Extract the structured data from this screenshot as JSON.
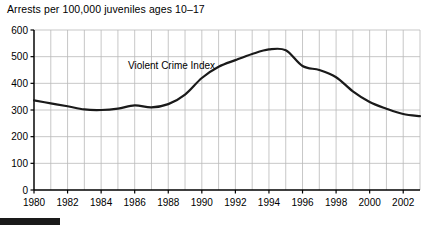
{
  "chart_data": {
    "type": "line",
    "title": "Arrests per 100,000 juveniles ages 10–17",
    "xlabel": "",
    "ylabel": "",
    "xlim": [
      1980,
      2003
    ],
    "ylim": [
      0,
      600
    ],
    "grid": true,
    "legend_position": "inline-annotation",
    "annotations": [
      {
        "text": "Violent Crime Index",
        "x": 1985.6,
        "y": 455
      }
    ],
    "y_ticks": [
      0,
      100,
      200,
      300,
      400,
      500,
      600
    ],
    "y_tick_labels": [
      "0",
      "100",
      "200",
      "300",
      "400",
      "500",
      "600"
    ],
    "x_ticks": [
      1980,
      1982,
      1984,
      1986,
      1988,
      1990,
      1992,
      1994,
      1996,
      1998,
      2000,
      2002
    ],
    "x_tick_labels": [
      "1980",
      "1982",
      "1984",
      "1986",
      "1988",
      "1990",
      "1992",
      "1994",
      "1996",
      "1998",
      "2000",
      "2002"
    ],
    "x_gridlines": [
      1980,
      1981,
      1982,
      1983,
      1984,
      1985,
      1986,
      1987,
      1988,
      1989,
      1990,
      1991,
      1992,
      1993,
      1994,
      1995,
      1996,
      1997,
      1998,
      1999,
      2000,
      2001,
      2002,
      2003
    ],
    "series": [
      {
        "name": "Violent Crime Index",
        "color": "#1a1a1a",
        "x": [
          1980,
          1981,
          1982,
          1983,
          1984,
          1985,
          1986,
          1987,
          1988,
          1989,
          1990,
          1991,
          1992,
          1993,
          1994,
          1995,
          1996,
          1997,
          1998,
          1999,
          2000,
          2001,
          2002,
          2003
        ],
        "values": [
          336,
          325,
          314,
          302,
          300,
          305,
          317,
          310,
          322,
          358,
          420,
          462,
          487,
          510,
          527,
          524,
          465,
          450,
          423,
          370,
          330,
          305,
          285,
          277
        ]
      }
    ]
  },
  "decorations": {
    "bottom_bar_color": "#1a1a1a"
  }
}
